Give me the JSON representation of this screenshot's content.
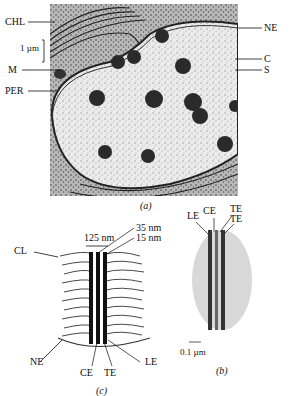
{
  "figure": {
    "panel_a": {
      "caption": "(a)",
      "scale_bar": "1 µm",
      "labels_left": [
        "CHL",
        "M",
        "PER"
      ],
      "labels_right": [
        "NE",
        "C",
        "S"
      ]
    },
    "panel_b": {
      "caption": "(b)",
      "scale_bar": "0.1 µm",
      "labels_top": [
        "LE",
        "CE",
        "TE",
        "TE"
      ]
    },
    "panel_c": {
      "caption": "(c)",
      "dimension_width": "125 nm",
      "dimension_35": "35 nm",
      "dimension_15": "15 nm",
      "label_cl": "CL",
      "label_ne": "NE",
      "labels_bottom": [
        "CE",
        "TE",
        "LE"
      ]
    }
  }
}
